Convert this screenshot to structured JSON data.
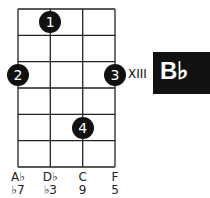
{
  "chord": {
    "name": "B♭",
    "position": "XIII"
  },
  "grid": {
    "strings": 4,
    "frets": 6
  },
  "dots": [
    {
      "finger": "1",
      "string": 1,
      "fret": 1
    },
    {
      "finger": "2",
      "string": 0,
      "fret": 3
    },
    {
      "finger": "3",
      "string": 3,
      "fret": 3
    },
    {
      "finger": "4",
      "string": 2,
      "fret": 5
    }
  ],
  "strings": [
    {
      "note": "A♭",
      "interval": "♭7"
    },
    {
      "note": "D♭",
      "interval": "♭3"
    },
    {
      "note": "C",
      "interval": "9"
    },
    {
      "note": "F",
      "interval": "5"
    }
  ]
}
